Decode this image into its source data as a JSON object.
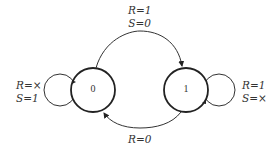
{
  "diagram": {
    "type": "state-transition-diagram",
    "states": [
      {
        "id": "0",
        "label": "0"
      },
      {
        "id": "1",
        "label": "1"
      }
    ],
    "transitions": [
      {
        "from": "0",
        "to": "1",
        "label_line1": "R=1",
        "label_line2": "S=0"
      },
      {
        "from": "1",
        "to": "0",
        "label_line1": "R=0",
        "label_line2": ""
      },
      {
        "from": "0",
        "to": "0",
        "label_line1": "R=×",
        "label_line2": "S=1"
      },
      {
        "from": "1",
        "to": "1",
        "label_line1": "R=1",
        "label_line2": "S=×"
      }
    ]
  },
  "colors": {
    "stroke": "#222222",
    "text": "#333333",
    "background": "#ffffff"
  }
}
